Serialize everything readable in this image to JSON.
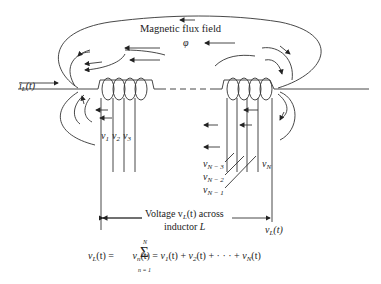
{
  "diagram": {
    "type": "inductor-magnetic-flux",
    "title": "Magnetic flux field",
    "flux_symbol": "φ",
    "current_label": {
      "base": "i",
      "sub": "L",
      "arg": "(t)"
    },
    "left_coil_voltages": [
      {
        "base": "v",
        "sub": "1"
      },
      {
        "base": "v",
        "sub": "2"
      },
      {
        "base": "v",
        "sub": "3"
      }
    ],
    "right_coil_voltages": [
      {
        "base": "v",
        "sub": "N − 3"
      },
      {
        "base": "v",
        "sub": "N − 2"
      },
      {
        "base": "v",
        "sub": "N − 1"
      },
      {
        "base": "v",
        "sub": "N"
      }
    ],
    "voltage_caption_line1": "Voltage v",
    "voltage_caption_sub": "L",
    "voltage_caption_line1_rest": "(t) across",
    "voltage_caption_line2": "inductor ",
    "voltage_caption_L": "L",
    "terminal_label": {
      "base": "v",
      "sub": "L",
      "arg": "(t)"
    },
    "equation": {
      "lhs_base": "v",
      "lhs_sub": "L",
      "lhs_arg": "(t) = ",
      "sum_symbol": "Σ",
      "sum_upper": "N",
      "sum_lower": "n = 1",
      "term_base": "v",
      "term_sub": "n",
      "term_arg": "(t) = ",
      "expansion": [
        {
          "base": "v",
          "sub": "1",
          "arg": "(t)"
        },
        {
          "base": "v",
          "sub": "2",
          "arg": "(t)"
        },
        {
          "base": "v",
          "sub": "N",
          "arg": "(t)"
        }
      ],
      "plus": " + ",
      "ellipsis": " · · · "
    }
  }
}
